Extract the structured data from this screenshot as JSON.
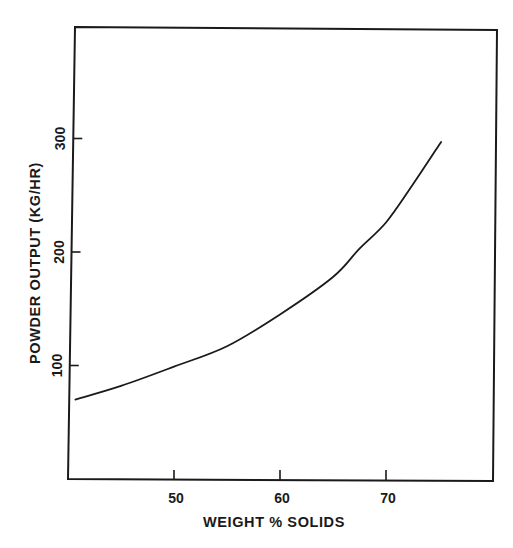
{
  "chart_data": {
    "type": "line",
    "title": "",
    "xlabel": "WEIGHT % SOLIDS",
    "ylabel": "POWDER OUTPUT (KG/HR)",
    "xlim": [
      40,
      80
    ],
    "ylim": [
      0,
      400
    ],
    "grid": false,
    "legend": null,
    "x_ticks": [
      50,
      60,
      70
    ],
    "x_tick_labels": [
      "50",
      "60",
      "70"
    ],
    "y_ticks": [
      100,
      200,
      300
    ],
    "y_tick_labels": [
      "100",
      "200",
      "300"
    ],
    "series": [
      {
        "name": "Powder output",
        "x": [
          40.7,
          45,
          50,
          55,
          60,
          65,
          67.5,
          70,
          72.5,
          75.2
        ],
        "y": [
          70,
          82,
          99,
          117,
          145,
          178,
          203,
          226,
          259,
          297
        ]
      }
    ]
  },
  "style": {
    "ink_color": "#1a1a1a",
    "background": "#ffffff"
  }
}
